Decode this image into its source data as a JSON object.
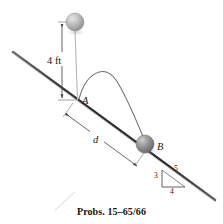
{
  "figure": {
    "caption": "Probs. 15–65/66",
    "labels": {
      "height": "4 ft",
      "point_a": "A",
      "point_b": "B",
      "distance": "d",
      "triangle_rise": "3",
      "triangle_run": "4",
      "triangle_hyp": "5"
    },
    "colors": {
      "incline": "#3a3a3a",
      "ball_top": "#b4b4b4",
      "ball_b": "#8a8a8a",
      "trajectory": "#6f6f6f",
      "dimension": "#4a4a4a",
      "text": "#1b1b1b",
      "background": "#ffffff"
    },
    "geometry": {
      "incline_start": [
        13,
        52
      ],
      "incline_end": [
        215,
        200
      ],
      "ball_top_center": [
        75,
        22
      ],
      "ball_top_radius": 9,
      "ball_b_center": [
        145,
        144
      ],
      "ball_b_radius": 9,
      "point_a": [
        78,
        100
      ],
      "drop_height_px": 78,
      "trajectory_peak": [
        110,
        76
      ]
    }
  }
}
